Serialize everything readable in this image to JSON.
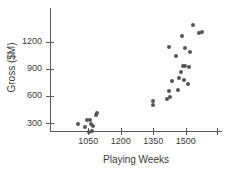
{
  "chart_data": {
    "type": "scatter",
    "title": "",
    "xlabel": "Playing Weeks",
    "ylabel": "Gross ($M)",
    "xlim": [
      980,
      1610
    ],
    "ylim": [
      150,
      1480
    ],
    "xticks": [
      1050,
      1200,
      1350,
      1500
    ],
    "yticks": [
      300,
      600,
      900,
      1200
    ],
    "grid": false,
    "legend": "none",
    "marker": {
      "shape": "circle",
      "color": "#565656",
      "size": 4
    },
    "points": [
      {
        "x": 1002,
        "y": 288
      },
      {
        "x": 1033,
        "y": 254
      },
      {
        "x": 1046,
        "y": 329
      },
      {
        "x": 1053,
        "y": 205
      },
      {
        "x": 1058,
        "y": 338
      },
      {
        "x": 1060,
        "y": 292
      },
      {
        "x": 1067,
        "y": 216
      },
      {
        "x": 1071,
        "y": 269
      },
      {
        "x": 1083,
        "y": 390
      },
      {
        "x": 1092,
        "y": 413
      },
      {
        "x": 1350,
        "y": 500
      },
      {
        "x": 1350,
        "y": 546
      },
      {
        "x": 1415,
        "y": 570
      },
      {
        "x": 1425,
        "y": 592
      },
      {
        "x": 1423,
        "y": 655
      },
      {
        "x": 1420,
        "y": 1140
      },
      {
        "x": 1438,
        "y": 760
      },
      {
        "x": 1456,
        "y": 1040
      },
      {
        "x": 1462,
        "y": 670
      },
      {
        "x": 1468,
        "y": 800
      },
      {
        "x": 1478,
        "y": 870
      },
      {
        "x": 1484,
        "y": 1260
      },
      {
        "x": 1488,
        "y": 930
      },
      {
        "x": 1492,
        "y": 775
      },
      {
        "x": 1495,
        "y": 930
      },
      {
        "x": 1498,
        "y": 1135
      },
      {
        "x": 1508,
        "y": 735
      },
      {
        "x": 1513,
        "y": 920
      },
      {
        "x": 1520,
        "y": 1090
      },
      {
        "x": 1533,
        "y": 1385
      },
      {
        "x": 1563,
        "y": 1300
      },
      {
        "x": 1575,
        "y": 1310
      }
    ]
  },
  "axes": {
    "x_tick_labels": [
      "1050",
      "1200",
      "1350",
      "1500"
    ],
    "y_tick_labels": [
      "300",
      "600",
      "900",
      "1200"
    ],
    "x_title": "Playing Weeks",
    "y_title": "Gross ($M)"
  },
  "colors": {
    "marker": "#565656",
    "axis": "#5a5a5a",
    "text": "#3a3a3a",
    "background": "#ffffff"
  }
}
